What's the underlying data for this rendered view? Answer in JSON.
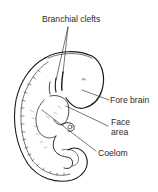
{
  "figure": {
    "colors": {
      "ink": "#1a1a1a",
      "text": "#2a2a2a",
      "background": "#ffffff"
    }
  },
  "labels": {
    "branchial_clefts": "Branchial clefts",
    "fore_brain": "Fore brain",
    "face_area_line1": "Face",
    "face_area_line2": "area",
    "coelom": "Coelom"
  }
}
